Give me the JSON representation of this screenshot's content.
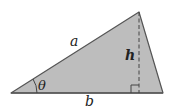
{
  "figure": {
    "type": "triangle-area-diagram",
    "fill_color": "#bdbdbd",
    "stroke_color": "#555555",
    "dash_color": "#444444",
    "vertices": {
      "left": [
        11,
        93
      ],
      "apex": [
        139,
        12
      ],
      "right": [
        163,
        93
      ]
    },
    "labels": {
      "side_a": "a",
      "height": "h",
      "angle": "θ",
      "base": "b"
    }
  }
}
